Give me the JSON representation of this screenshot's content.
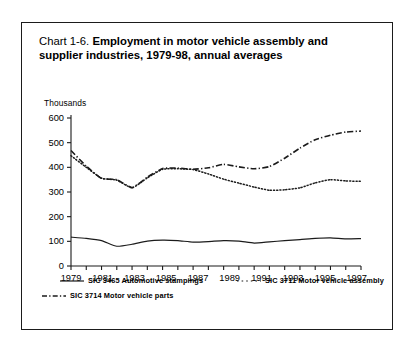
{
  "chart_data": {
    "type": "line",
    "title_prefix": "Chart 1-6.",
    "title": "Employment in motor vehicle assembly and supplier industries, 1979-98, annual averages",
    "title_line1": "Employment in motor vehicle assembly and",
    "title_line2": "supplier industries, 1979-98, annual averages",
    "ylabel": "Thousands",
    "xlabel": "",
    "ylim": [
      0,
      600
    ],
    "yticks": [
      0,
      100,
      200,
      300,
      400,
      500,
      600
    ],
    "ytick_labels": [
      "0",
      "100",
      "200",
      "300",
      "400",
      "500",
      "600"
    ],
    "xlim": [
      1979,
      1998
    ],
    "x": [
      1979,
      1980,
      1981,
      1982,
      1983,
      1984,
      1985,
      1986,
      1987,
      1988,
      1989,
      1990,
      1991,
      1992,
      1993,
      1994,
      1995,
      1996,
      1997,
      1998
    ],
    "xtick_labels": [
      "1979",
      "1981",
      "1983",
      "1985",
      "1987",
      "1989",
      "1991",
      "1993",
      "1995",
      "1997"
    ],
    "xticks_major": [
      1979,
      1981,
      1983,
      1985,
      1987,
      1989,
      1991,
      1993,
      1995,
      1997
    ],
    "grid": false,
    "legend_position": "below-axes",
    "series": [
      {
        "name": "SIC  3465 Automotive stampings",
        "sic": "3465",
        "label": "Automotive stampings",
        "style": "solid",
        "color": "#1b1b1b",
        "values": [
          117,
          112,
          103,
          80,
          88,
          101,
          105,
          103,
          97,
          99,
          103,
          101,
          93,
          98,
          103,
          107,
          112,
          114,
          110,
          111
        ]
      },
      {
        "name": "SIC  3711 Motor vehicle assembly",
        "sic": "3711",
        "label": "Motor vehicle assembly",
        "style": "dotted",
        "color": "#1b1b1b",
        "values": [
          447,
          400,
          356,
          348,
          317,
          357,
          392,
          394,
          391,
          373,
          352,
          336,
          320,
          307,
          309,
          317,
          337,
          350,
          345,
          343
        ]
      },
      {
        "name": "SIC  3714 Motor vehicle parts",
        "sic": "3714",
        "label": "Motor vehicle parts",
        "style": "dash-dot",
        "color": "#1b1b1b",
        "values": [
          468,
          405,
          355,
          350,
          318,
          360,
          395,
          397,
          392,
          398,
          412,
          402,
          394,
          403,
          437,
          478,
          512,
          530,
          543,
          547
        ]
      }
    ]
  },
  "legend": {
    "entries": [
      {
        "label": "SIC  3465 Automotive stampings",
        "style": "solid"
      },
      {
        "label": "SIC  3711 Motor vehicle assembly",
        "style": "dotted"
      },
      {
        "label": "SIC  3714 Motor vehicle parts",
        "style": "dash-dot"
      }
    ]
  }
}
